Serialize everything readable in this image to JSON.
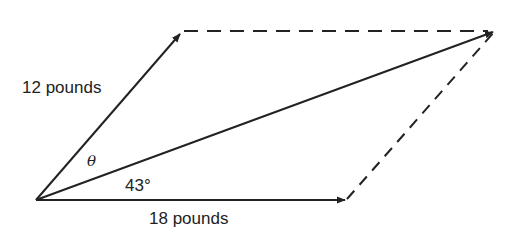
{
  "diagram": {
    "type": "vector-parallelogram",
    "vectors": [
      {
        "name": "force-1",
        "label": "12 pounds",
        "magnitude": 12,
        "unit": "pounds"
      },
      {
        "name": "force-2",
        "label": "18 pounds",
        "magnitude": 18,
        "unit": "pounds"
      },
      {
        "name": "resultant",
        "label": ""
      }
    ],
    "angles": {
      "theta_label": "θ",
      "known_angle_label": "43°"
    },
    "colors": {
      "line": "#222222",
      "background": "#ffffff"
    }
  }
}
